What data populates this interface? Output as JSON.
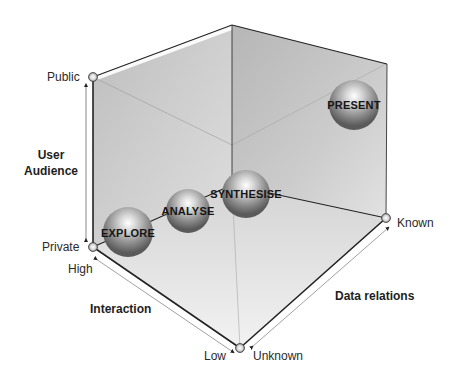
{
  "diagram": {
    "type": "3d-cube-framework",
    "axes": {
      "vertical": {
        "title_line1": "User",
        "title_line2": "Audience",
        "high_label": "Public",
        "low_label": "Private"
      },
      "left_diagonal": {
        "title": "Interaction",
        "high_label": "High",
        "low_label": "Low"
      },
      "right_diagonal": {
        "title": "Data relations",
        "high_label": "Known",
        "low_label": "Unknown"
      }
    },
    "stages": [
      {
        "label": "EXPLORE"
      },
      {
        "label": "ANALYSE"
      },
      {
        "label": "SYNTHESISE"
      },
      {
        "label": "PRESENT"
      }
    ]
  }
}
